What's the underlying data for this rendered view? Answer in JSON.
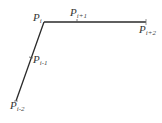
{
  "diagram": {
    "title": "",
    "line_color": "#2a2a2a",
    "points": [
      {
        "id": "p_i_minus_2",
        "base": "P",
        "sub": "i-2",
        "x": 16,
        "y": 101,
        "label_x": 10,
        "label_y": 109
      },
      {
        "id": "p_i_minus_1",
        "base": "P",
        "sub": "i-1",
        "x": 31,
        "y": 58,
        "label_x": 33,
        "label_y": 63
      },
      {
        "id": "p_i",
        "base": "P",
        "sub": "i",
        "x": 44,
        "y": 22,
        "label_x": 33,
        "label_y": 21
      },
      {
        "id": "p_i_plus_1",
        "base": "P",
        "sub": "i+1",
        "x": 77,
        "y": 22,
        "label_x": 70,
        "label_y": 16
      },
      {
        "id": "p_i_plus_2",
        "base": "P",
        "sub": "i+2",
        "x": 146,
        "y": 22,
        "label_x": 139,
        "label_y": 33
      }
    ],
    "segments": [
      {
        "from": "p_i_minus_2",
        "to": "p_i"
      },
      {
        "from": "p_i",
        "to": "p_i_plus_2"
      }
    ]
  }
}
